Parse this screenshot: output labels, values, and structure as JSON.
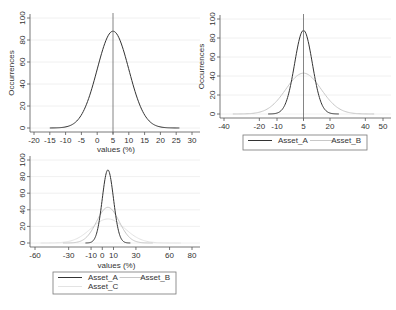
{
  "chart_data": [
    {
      "type": "line",
      "title": "",
      "xlabel": "values (%)",
      "ylabel": "Occurrences",
      "xticks": [
        -20,
        -15,
        -10,
        -5,
        0,
        5,
        10,
        15,
        20,
        25,
        30
      ],
      "yticks": [
        0,
        20,
        40,
        60,
        80,
        100
      ],
      "xlim": [
        -20,
        30
      ],
      "ylim": [
        0,
        100
      ],
      "grid": true,
      "vline": 5,
      "legend": null,
      "series": [
        {
          "name": "Asset_A",
          "mean": 5,
          "sd": 5,
          "peak": 88,
          "range": [
            -15,
            26
          ],
          "color": "#333333"
        }
      ]
    },
    {
      "type": "line",
      "title": "",
      "xlabel": "",
      "ylabel": "Occurrences",
      "xticks": [
        -40,
        -20,
        -10,
        5,
        20,
        40,
        50
      ],
      "yticks": [
        0,
        20,
        40,
        60,
        80,
        100
      ],
      "xlim": [
        -40,
        50
      ],
      "ylim": [
        0,
        100
      ],
      "grid": true,
      "vline": 5,
      "legend": [
        "Asset_A",
        "Asset_B"
      ],
      "series": [
        {
          "name": "Asset_A",
          "mean": 5,
          "sd": 5,
          "peak": 88,
          "range": [
            -15,
            25
          ],
          "color": "#333333"
        },
        {
          "name": "Asset_B",
          "mean": 5,
          "sd": 10,
          "peak": 43,
          "range": [
            -35,
            45
          ],
          "color": "#c8c8c8"
        }
      ]
    },
    {
      "type": "line",
      "title": "",
      "xlabel": "values (%)",
      "ylabel": "",
      "xticks": [
        -60,
        -30,
        -10,
        0,
        10,
        30,
        60,
        80
      ],
      "yticks": [
        0,
        20,
        40,
        60,
        80,
        100
      ],
      "xlim": [
        -60,
        80
      ],
      "ylim": [
        0,
        100
      ],
      "grid": true,
      "vline": null,
      "legend": [
        "Asset_A",
        "Asset_B",
        "Asset_C"
      ],
      "series": [
        {
          "name": "Asset_A",
          "mean": 5,
          "sd": 5,
          "peak": 88,
          "range": [
            -15,
            25
          ],
          "color": "#333333"
        },
        {
          "name": "Asset_B",
          "mean": 5,
          "sd": 10,
          "peak": 43,
          "range": [
            -35,
            45
          ],
          "color": "#c8c8c8"
        },
        {
          "name": "Asset_C",
          "mean": 5,
          "sd": 15,
          "peak": 29,
          "range": [
            -55,
            70
          ],
          "color": "#e3e3e3"
        }
      ]
    }
  ],
  "layout": [
    {
      "px": [
        34,
        192
      ],
      "py": [
        128,
        18
      ],
      "axisX": 30,
      "xlabelY": 152,
      "vlineTop": 13
    },
    {
      "px": [
        224,
        383
      ],
      "py": [
        114,
        19
      ],
      "axisX": 220,
      "xlabelY": null,
      "vlineTop": 14,
      "legendBox": [
        243,
        135,
        124,
        15
      ]
    },
    {
      "px": [
        35,
        192
      ],
      "py": [
        243,
        160
      ],
      "axisX": 30,
      "xlabelY": 268,
      "vlineTop": null,
      "legendBox": [
        53,
        272,
        123,
        22
      ]
    }
  ]
}
